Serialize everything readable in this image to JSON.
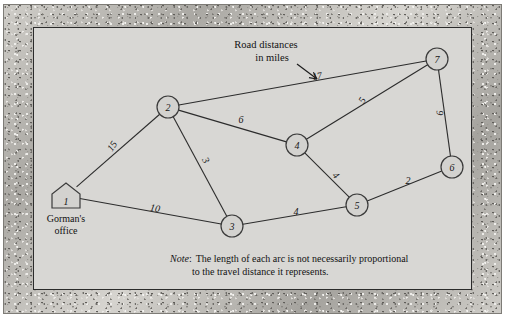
{
  "figure": {
    "title_callout": {
      "line1": "Road distances",
      "line2": "in miles"
    },
    "note": {
      "label": "Note",
      "colon": ":",
      "line1": "The length of each arc is not necessarily proportional",
      "line2": "to the travel distance it represents."
    },
    "office_label": {
      "line1": "Gorman's",
      "line2": "office"
    },
    "colors": {
      "canvas": "#d8d7d4",
      "node_fill": "#d3d2cf",
      "stroke": "#2c2c2c",
      "frame": "#b9b7b2"
    }
  },
  "chart_data": {
    "type": "diagram",
    "subtype": "undirected-weighted-network",
    "title": "Road distances in miles",
    "units": "miles",
    "nodes": [
      {
        "id": "1",
        "label": "1",
        "shape": "house",
        "x": 66,
        "y": 196,
        "annotation": "Gorman's office"
      },
      {
        "id": "2",
        "label": "2",
        "shape": "circle",
        "x": 168,
        "y": 107
      },
      {
        "id": "3",
        "label": "3",
        "shape": "circle",
        "x": 232,
        "y": 226
      },
      {
        "id": "4",
        "label": "4",
        "shape": "circle",
        "x": 297,
        "y": 145
      },
      {
        "id": "5",
        "label": "5",
        "shape": "circle",
        "x": 357,
        "y": 205
      },
      {
        "id": "6",
        "label": "6",
        "shape": "circle",
        "x": 452,
        "y": 167
      },
      {
        "id": "7",
        "label": "7",
        "shape": "circle",
        "x": 437,
        "y": 59
      }
    ],
    "edges": [
      {
        "from": "1",
        "to": "2",
        "weight": 15,
        "label": "15",
        "lx": 112,
        "ly": 146,
        "rot": -55
      },
      {
        "from": "1",
        "to": "3",
        "weight": 10,
        "label": "10",
        "lx": 155,
        "ly": 208,
        "rot": 10
      },
      {
        "from": "2",
        "to": "7",
        "weight": 17,
        "label": "17",
        "lx": 317,
        "ly": 76,
        "rot": -10
      },
      {
        "from": "2",
        "to": "4",
        "weight": 6,
        "label": "6",
        "lx": 241,
        "ly": 119,
        "rot": 0
      },
      {
        "from": "2",
        "to": "3",
        "weight": 3,
        "label": "3",
        "lx": 206,
        "ly": 160,
        "rot": 62
      },
      {
        "from": "4",
        "to": "7",
        "weight": 5,
        "label": "5",
        "lx": 362,
        "ly": 100,
        "rot": -60
      },
      {
        "from": "4",
        "to": "5",
        "weight": 4,
        "label": "4",
        "lx": 336,
        "ly": 175,
        "rot": 46
      },
      {
        "from": "3",
        "to": "5",
        "weight": 4,
        "label": "4",
        "lx": 296,
        "ly": 211,
        "rot": 0
      },
      {
        "from": "5",
        "to": "6",
        "weight": 2,
        "label": "2",
        "lx": 408,
        "ly": 180,
        "rot": 0
      },
      {
        "from": "7",
        "to": "6",
        "weight": 9,
        "label": "9",
        "lx": 440,
        "ly": 113,
        "rot": 88
      }
    ],
    "legend_position": "top-center",
    "grid": false
  }
}
